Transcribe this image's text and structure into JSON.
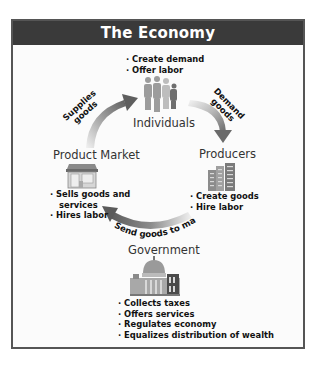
{
  "title": "The Economy",
  "nodes": {
    "individuals": {
      "label": "Individuals",
      "icon": "people-icon",
      "bullets": [
        "· Create demand",
        "· Offer labor"
      ]
    },
    "producers": {
      "label": "Producers",
      "icon": "factory-buildings-icon",
      "bullets": [
        "· Create goods",
        "· Hire labor"
      ]
    },
    "product_market": {
      "label": "Product Market",
      "icon": "storefront-icon",
      "bullets": [
        "· Sells goods and",
        "services",
        "· Hires labor"
      ]
    },
    "government": {
      "label": "Government",
      "icon": "capitol-building-icon",
      "bullets": [
        "· Collects taxes",
        "· Offers services",
        "· Regulates economy",
        "· Equalizes distribution of wealth"
      ]
    }
  },
  "arrows": {
    "supplies_goods": {
      "line1": "Supplies",
      "line2": "goods",
      "from": "Product Market",
      "to": "Individuals"
    },
    "demand_goods": {
      "line1": "Demand",
      "line2": "goods",
      "from": "Individuals",
      "to": "Producers"
    },
    "send_goods": {
      "label": "Send goods to market",
      "from": "Producers",
      "to": "Product Market"
    }
  },
  "colors": {
    "header_bg": "#3a3a3a",
    "frame_border": "#555555",
    "arrow_dark": "#6e6e6e",
    "arrow_light": "#e6e6e6"
  }
}
